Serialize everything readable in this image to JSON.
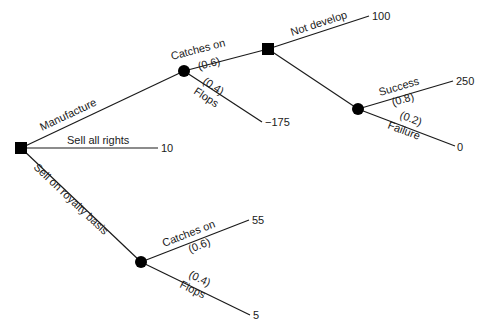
{
  "diagram": {
    "type": "decision-tree",
    "nodes": {
      "root": {
        "kind": "decision",
        "x": 21,
        "y": 148
      },
      "manufacture_chance": {
        "kind": "chance",
        "x": 184,
        "y": 71
      },
      "develop_decision": {
        "kind": "decision",
        "x": 268,
        "y": 49
      },
      "develop_chance": {
        "kind": "chance",
        "x": 358,
        "y": 109
      },
      "royalty_chance": {
        "kind": "chance",
        "x": 141,
        "y": 262
      }
    },
    "branches": {
      "manufacture": {
        "label": "Manufacture"
      },
      "sell_all_rights": {
        "label": "Sell all rights",
        "payoff": "10"
      },
      "royalty": {
        "label": "Sell on royalty basis"
      },
      "mfg_catches_on": {
        "label": "Catches on",
        "prob": "(0.6)"
      },
      "mfg_flops": {
        "label": "Flops",
        "prob": "(0.4)",
        "payoff": "−175"
      },
      "not_develop": {
        "label": "Not develop",
        "payoff": "100"
      },
      "success": {
        "label": "Success",
        "prob": "(0.8)",
        "payoff": "250"
      },
      "failure": {
        "label": "Failure",
        "prob": "(0.2)",
        "payoff": "0"
      },
      "roy_catches_on": {
        "label": "Catches on",
        "prob": "(0.6)",
        "payoff": "55"
      },
      "roy_flops": {
        "label": "Flops",
        "prob": "(0.4)",
        "payoff": "5"
      }
    }
  }
}
